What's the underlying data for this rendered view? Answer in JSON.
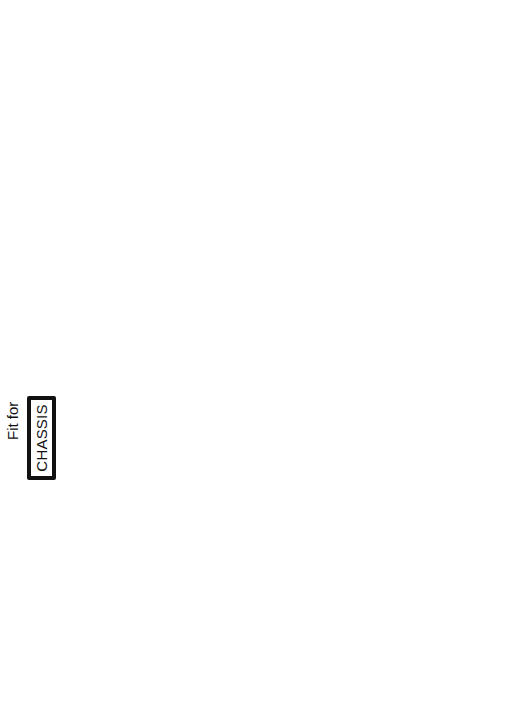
{
  "diagram": {
    "fit_for_label": "Fit for",
    "stages": [
      {
        "label": "CHASSIS",
        "note": "",
        "items": [
          "Frame or monocoque",
          "Suspension",
          "Differential (if IRS) or axle",
          "Hubs",
          "Wheels and tyres"
        ]
      },
      {
        "label": "ROLLING CHASSIS",
        "note": "Use as base for further construction",
        "items": [
          "Engine, gearbox and prop",
          "Electrical wiring & battery",
          "Fuel tank & piping",
          "Brake hydraulics",
          "Steering"
        ]
      },
      {
        "label": "RUNNING CHASSIS",
        "note": "Double-check for safety",
        "items": [
          "Lights",
          "Mudguards",
          "Seatbelts & Seats",
          "Instruments",
          "Insurance",
          "Taxes and registration"
        ]
      },
      {
        "label": "ROAD-LEGAL CHASSIS",
        "note": "Road-test and Rectify",
        "items": [
          "Body",
          "Trim"
        ]
      },
      {
        "label": "CAR",
        "note": "Test & Rectify",
        "items": []
      }
    ]
  }
}
